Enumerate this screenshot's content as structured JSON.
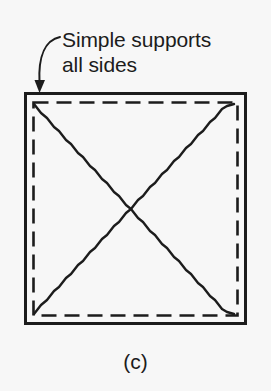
{
  "figure": {
    "caption": "(c)",
    "annotation": {
      "line1": "Simple supports",
      "line2": "all sides",
      "leader": "curved-arrow-icon"
    },
    "colors": {
      "background": "#f7f7f7",
      "ink": "#1c1c1c",
      "plate_border": "#1c1c1c",
      "support_dash": "#1c1c1c",
      "yield_line": "#1c1c1c"
    },
    "plate": {
      "shape": "square",
      "support_condition": "simple supports all sides",
      "outer_border_style": "solid",
      "outer_border_width_px": 3,
      "support_line_style": "dashed",
      "support_dash_pattern": "14 7",
      "support_inset_px": 8,
      "bounds": {
        "x": 25,
        "y": 93,
        "width": 221,
        "height": 231
      }
    },
    "yield_lines": {
      "pattern": "diagonal-x",
      "count": 2,
      "style": "wavy",
      "description": "Two wavy yield lines running corner to corner forming an X",
      "endpoints": [
        {
          "from": "top-left",
          "to": "bottom-right"
        },
        {
          "from": "bottom-left",
          "to": "top-right"
        }
      ]
    }
  }
}
